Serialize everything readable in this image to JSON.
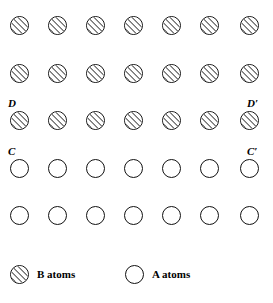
{
  "figure": {
    "type": "crystal-lattice-diagram",
    "background_color": "#ffffff",
    "outline_color": "#111111",
    "hatch_color": "#111111"
  },
  "lattice": {
    "columns": 7,
    "rows": 5,
    "circle_diameter_px": 19,
    "column_x": [
      19,
      57,
      95,
      133,
      171,
      209,
      249
    ],
    "row_y": [
      25,
      73,
      120,
      168,
      215
    ],
    "rows_data": [
      {
        "index": 0,
        "atom_type": "B",
        "fill": "hatched",
        "count": 7
      },
      {
        "index": 1,
        "atom_type": "B",
        "fill": "hatched",
        "count": 7
      },
      {
        "index": 2,
        "atom_type": "B",
        "fill": "hatched",
        "count": 7
      },
      {
        "index": 3,
        "atom_type": "A",
        "fill": "open",
        "count": 7
      },
      {
        "index": 4,
        "atom_type": "A",
        "fill": "open",
        "count": 7
      }
    ]
  },
  "labels": [
    {
      "id": "D",
      "text": "D",
      "row_index": 2,
      "side": "left",
      "x": 8,
      "y": 98
    },
    {
      "id": "Dp",
      "text": "D′",
      "row_index": 2,
      "side": "right",
      "x": 247,
      "y": 98
    },
    {
      "id": "C",
      "text": "C",
      "row_index": 3,
      "side": "left",
      "x": 8,
      "y": 146
    },
    {
      "id": "Cp",
      "text": "C′",
      "row_index": 3,
      "side": "right",
      "x": 247,
      "y": 146
    }
  ],
  "legend": {
    "entries": [
      {
        "id": "b-atoms",
        "label": "B atoms",
        "symbol": "hatched-circle",
        "x": 10
      },
      {
        "id": "a-atoms",
        "label": "A atoms",
        "symbol": "open-circle",
        "x": 125
      }
    ]
  },
  "chart_data": {
    "type": "scatter",
    "title": "",
    "xlabel": "",
    "ylabel": "",
    "grid": false,
    "legend_position": "bottom",
    "series": [
      {
        "name": "B atoms",
        "marker": "hatched-circle",
        "x": [
          19,
          57,
          95,
          133,
          171,
          209,
          249,
          19,
          57,
          95,
          133,
          171,
          209,
          249,
          19,
          57,
          95,
          133,
          171,
          209,
          249
        ],
        "y": [
          25,
          25,
          25,
          25,
          25,
          25,
          25,
          73,
          73,
          73,
          73,
          73,
          73,
          73,
          120,
          120,
          120,
          120,
          120,
          120,
          120
        ]
      },
      {
        "name": "A atoms",
        "marker": "open-circle",
        "x": [
          19,
          57,
          95,
          133,
          171,
          209,
          249,
          19,
          57,
          95,
          133,
          171,
          209,
          249
        ],
        "y": [
          168,
          168,
          168,
          168,
          168,
          168,
          168,
          215,
          215,
          215,
          215,
          215,
          215,
          215
        ]
      }
    ],
    "annotations": [
      {
        "text": "D",
        "x": 8,
        "y": 98
      },
      {
        "text": "D′",
        "x": 247,
        "y": 98
      },
      {
        "text": "C",
        "x": 8,
        "y": 146
      },
      {
        "text": "C′",
        "x": 247,
        "y": 146
      }
    ]
  }
}
